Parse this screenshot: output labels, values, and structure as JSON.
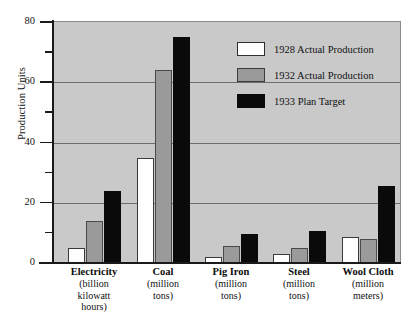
{
  "chart_data": {
    "type": "bar",
    "title": "",
    "xlabel": "",
    "ylabel": "Production Units",
    "ylim": [
      0,
      80
    ],
    "grid": true,
    "legend_position": "inside top-right",
    "categories": [
      "Electricity",
      "Coal",
      "Pig Iron",
      "Steel",
      "Wool Cloth"
    ],
    "category_units": [
      "(billion\nkilowatt\nhours)",
      "(million\ntons)",
      "(million\ntons)",
      "(million\ntons)",
      "(million\nmeters)"
    ],
    "series": [
      {
        "name": "1928 Actual Production",
        "color": "#ffffff",
        "values": [
          5,
          35,
          2,
          3,
          8.5
        ]
      },
      {
        "name": "1932 Actual Production",
        "color": "#9a9a9a",
        "values": [
          14,
          64,
          5.5,
          5,
          8
        ]
      },
      {
        "name": "1933 Plan Target",
        "color": "#0a0a0a",
        "values": [
          24,
          75,
          9.5,
          10.5,
          25.5
        ]
      }
    ],
    "y_ticks_major": [
      0,
      20,
      40,
      60,
      80
    ],
    "y_ticks_minor": [
      10,
      30,
      50,
      70
    ],
    "y_tick_labels": [
      "0",
      "20",
      "40",
      "60",
      "80"
    ],
    "gridline_values": [
      20,
      40,
      60,
      80
    ],
    "plot_background": "#c9c9c9"
  },
  "axis": {
    "y_title": "Production Units"
  },
  "legend": {
    "entries": [
      {
        "label": "1928 Actual Production"
      },
      {
        "label": "1932 Actual Production"
      },
      {
        "label": "1933 Plan Target"
      }
    ]
  },
  "categories": [
    {
      "name": "Electricity",
      "unit_line1": "(billion",
      "unit_line2": "kilowatt",
      "unit_line3": "hours)"
    },
    {
      "name": "Coal",
      "unit_line1": "(million",
      "unit_line2": "tons)",
      "unit_line3": ""
    },
    {
      "name": "Pig Iron",
      "unit_line1": "(million",
      "unit_line2": "tons)",
      "unit_line3": ""
    },
    {
      "name": "Steel",
      "unit_line1": "(million",
      "unit_line2": "tons)",
      "unit_line3": ""
    },
    {
      "name": "Wool Cloth",
      "unit_line1": "(million",
      "unit_line2": "meters)",
      "unit_line3": ""
    }
  ],
  "y_tick_labels": [
    "80",
    "60",
    "40",
    "20",
    "0"
  ]
}
